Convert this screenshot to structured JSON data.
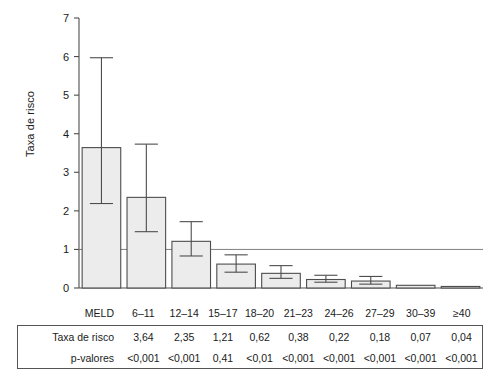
{
  "chart_data": {
    "type": "bar",
    "title": "",
    "xlabel": "MELD",
    "ylabel": "Taxa de risco",
    "categories": [
      "6–11",
      "12–14",
      "15–17",
      "18–20",
      "21–23",
      "24–26",
      "27–29",
      "30–39",
      "≥40"
    ],
    "values": [
      3.64,
      2.35,
      1.21,
      0.62,
      0.38,
      0.22,
      0.18,
      0.07,
      0.04
    ],
    "error_low": [
      2.19,
      1.46,
      0.83,
      0.41,
      0.25,
      0.15,
      0.1,
      0.07,
      0.04
    ],
    "error_high": [
      5.97,
      3.73,
      1.72,
      0.86,
      0.58,
      0.33,
      0.3,
      0.07,
      0.04
    ],
    "p_values": [
      "<0,001",
      "<0,001",
      "0,41",
      "<0,01",
      "<0,001",
      "<0,001",
      "<0,001",
      "<0,001",
      "<0,001"
    ],
    "yticks": [
      0,
      1,
      2,
      3,
      4,
      5,
      6,
      7
    ],
    "ytick_labels": [
      "0",
      "1",
      "2",
      "3",
      "4",
      "5",
      "6",
      "7"
    ],
    "ylim": [
      0,
      7
    ],
    "reference_line": 1,
    "grid": false,
    "legend": false,
    "bar_fill": "#ececec",
    "bar_stroke": "#4d4d4d",
    "error_color": "#4d4d4d",
    "axis_color": "#4d4d4d"
  },
  "table": {
    "header_label": "MELD",
    "columns": [
      "6–11",
      "12–14",
      "15–17",
      "18–20",
      "21–23",
      "24–26",
      "27–29",
      "30–39",
      "≥40"
    ],
    "rows": [
      {
        "label": "Taxa de risco",
        "cells": [
          "3,64",
          "2,35",
          "1,21",
          "0,62",
          "0,38",
          "0,22",
          "0,18",
          "0,07",
          "0,04"
        ]
      },
      {
        "label": "p-valores",
        "cells": [
          "<0,001",
          "<0,001",
          "0,41",
          "<0,01",
          "<0,001",
          "<0,001",
          "<0,001",
          "<0,001",
          "<0,001"
        ]
      }
    ]
  }
}
